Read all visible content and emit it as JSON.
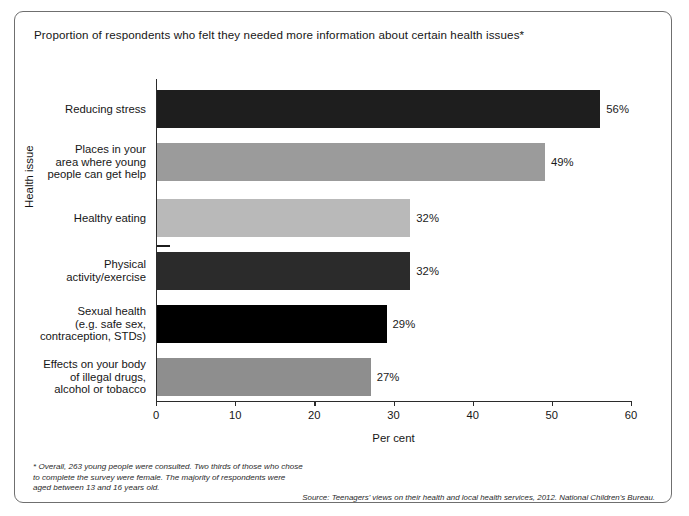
{
  "chart_data": {
    "type": "bar",
    "orientation": "horizontal",
    "title": "Proportion of respondents who felt they needed more information about certain health issues*",
    "xlabel": "Per cent",
    "ylabel": "Health issue",
    "xlim": [
      0,
      60
    ],
    "xticks": [
      0,
      10,
      20,
      30,
      40,
      50,
      60
    ],
    "grid": false,
    "legend": null,
    "categories": [
      "Reducing stress",
      "Places in your area where young people can get help",
      "Healthy eating",
      "Physical activity/exercise",
      "Sexual health (e.g. safe sex, contraception, STDs)",
      "Effects on your body of illegal drugs, alcohol or tobacco"
    ],
    "values": [
      56,
      49,
      32,
      32,
      29,
      27
    ],
    "value_labels": [
      "56%",
      "49%",
      "32%",
      "32%",
      "29%",
      "27%"
    ],
    "bars": [
      {
        "label_lines": [
          "Reducing stress"
        ],
        "value": 56,
        "value_label": "56%",
        "color": "#1e1e1e",
        "textured": false
      },
      {
        "label_lines": [
          "Places in your",
          "area where young",
          "people can get help"
        ],
        "value": 49,
        "value_label": "49%",
        "color": "#9b9b9b",
        "textured": true
      },
      {
        "label_lines": [
          "Healthy eating"
        ],
        "value": 32,
        "value_label": "32%",
        "color": "#b9b9b9",
        "textured": false
      },
      {
        "label_lines": [
          "Physical",
          "activity/exercise"
        ],
        "value": 32,
        "value_label": "32%",
        "color": "#2b2b2b",
        "textured": false
      },
      {
        "label_lines": [
          "Sexual health",
          "(e.g. safe sex,",
          "contraception, STDs)"
        ],
        "value": 29,
        "value_label": "29%",
        "color": "#000000",
        "textured": false
      },
      {
        "label_lines": [
          "Effects on your body",
          "of illegal drugs,",
          "alcohol or tobacco"
        ],
        "value": 27,
        "value_label": "27%",
        "color": "#8e8e8e",
        "textured": true
      }
    ]
  },
  "footnote": {
    "lines": [
      "* Overall, 263 young people were consulted. Two thirds of those who chose",
      "to complete the survey were female. The majority of respondents were",
      "aged between 13 and 16 years old."
    ]
  },
  "source": {
    "text": "Source: Teenagers' views on their health and local health services, 2012. National Children's Bureau."
  }
}
